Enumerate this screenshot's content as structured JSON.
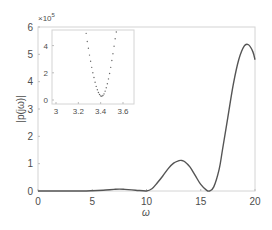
{
  "chart_data": [
    {
      "type": "line",
      "role": "main",
      "title": "",
      "xlabel": "ω",
      "ylabel": "|p(jω)|",
      "xlim": [
        0,
        20
      ],
      "ylim": [
        0,
        6
      ],
      "xticks": [
        0,
        5,
        10,
        15,
        20
      ],
      "yticks": [
        0,
        1,
        2,
        3,
        4,
        5,
        6
      ],
      "grid": false,
      "legend": null,
      "series": [
        {
          "name": "|p(jω)|",
          "color": "#555555",
          "x": [
            0,
            2,
            4,
            5,
            6,
            7,
            7.5,
            8,
            9,
            10,
            10.5,
            11,
            11.5,
            12,
            12.5,
            13,
            13.2,
            13.5,
            14,
            14.5,
            15,
            15.5,
            15.8,
            16.2,
            16.7,
            17,
            17.5,
            18,
            18.5,
            19,
            19.4,
            19.8,
            20
          ],
          "y": [
            0.0,
            0.0,
            0.0,
            0.01,
            0.03,
            0.06,
            0.07,
            0.06,
            0.03,
            0.0,
            0.08,
            0.3,
            0.55,
            0.82,
            1.02,
            1.11,
            1.12,
            1.08,
            0.88,
            0.56,
            0.24,
            0.04,
            0.0,
            0.15,
            0.8,
            1.5,
            2.7,
            3.9,
            4.8,
            5.3,
            5.35,
            5.1,
            4.8
          ]
        }
      ]
    },
    {
      "type": "scatter",
      "role": "inset",
      "title": "",
      "xlabel": "",
      "ylabel": "",
      "y_scale_label": "×10^5",
      "xlim": [
        3,
        3.7
      ],
      "ylim": [
        0,
        5
      ],
      "xticks": [
        3,
        3.2,
        3.4,
        3.6
      ],
      "yticks": [
        0,
        2,
        4
      ],
      "grid": false,
      "series": [
        {
          "name": "inset detail",
          "color": "#666666",
          "x": [
            3.27,
            3.28,
            3.29,
            3.3,
            3.31,
            3.32,
            3.33,
            3.34,
            3.35,
            3.36,
            3.37,
            3.38,
            3.39,
            3.4,
            3.41,
            3.42,
            3.43,
            3.44,
            3.45,
            3.46,
            3.47,
            3.48,
            3.49,
            3.5,
            3.51,
            3.52,
            3.53,
            3.54
          ],
          "y": [
            4.9,
            4.3,
            3.8,
            3.3,
            2.85,
            2.4,
            2.0,
            1.65,
            1.3,
            1.0,
            0.75,
            0.55,
            0.4,
            0.3,
            0.28,
            0.33,
            0.45,
            0.65,
            0.9,
            1.2,
            1.55,
            1.95,
            2.4,
            2.9,
            3.4,
            3.95,
            4.5,
            5.0
          ]
        }
      ]
    }
  ],
  "labels": {
    "xlabel": "ω",
    "ylabel": "|p(jω)|",
    "inset_scale": "×10",
    "inset_scale_exp": "5"
  },
  "ticks": {
    "x": [
      "0",
      "5",
      "10",
      "15",
      "20"
    ],
    "y": [
      "0",
      "1",
      "2",
      "3",
      "4",
      "5",
      "6"
    ],
    "inset_x": [
      "3",
      "3.2",
      "3.4",
      "3.6"
    ],
    "inset_y": [
      "0",
      "2",
      "4"
    ]
  },
  "colors": {
    "axis": "#d0d0d0",
    "line": "#555555",
    "text": "#4d4d4d"
  }
}
